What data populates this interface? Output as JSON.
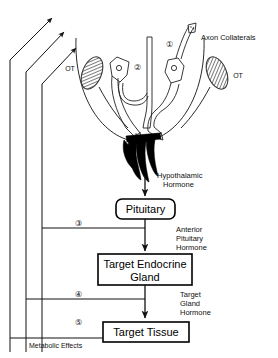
{
  "figure": {
    "background_color": "#ffffff",
    "ink_color": "#111111"
  },
  "anatomy": {
    "axon_collaterals_label": "Axon Collaterals",
    "optic_tract_left_label": "OT",
    "optic_tract_right_label": "OT",
    "neuron_marker_1": "①",
    "neuron_marker_2": "②"
  },
  "boxes": [
    {
      "id": "pituitary",
      "label": "Pituitary",
      "shape": "rounded-rect"
    },
    {
      "id": "target-endocrine-gland",
      "label_line1": "Target  Endocrine",
      "label_line2": "Gland",
      "shape": "rect"
    },
    {
      "id": "target-tissue",
      "label": "Target  Tissue",
      "shape": "rect"
    }
  ],
  "flow_labels": [
    {
      "id": "hypothalamic-hormone",
      "line1": "Hypothalamic",
      "line2": "Hormone"
    },
    {
      "id": "anterior-pituitary-hormone",
      "line1": "Anterior",
      "line2": "Pituitary",
      "line3": "Hormone"
    },
    {
      "id": "target-gland-hormone",
      "line1": "Target",
      "line2": "Gland",
      "line3": "Hormone"
    },
    {
      "id": "metabolic-effects",
      "line1": "Metabolic  Effects"
    }
  ],
  "feedback_loops": [
    {
      "id": "loop-3",
      "marker": "③",
      "source": "pituitary",
      "note": "short-loop feedback"
    },
    {
      "id": "loop-4",
      "marker": "④",
      "source": "target-endocrine-gland",
      "note": "long-loop feedback"
    },
    {
      "id": "loop-5",
      "marker": "⑤",
      "source": "target-tissue",
      "note": "metabolic-effect feedback"
    }
  ]
}
